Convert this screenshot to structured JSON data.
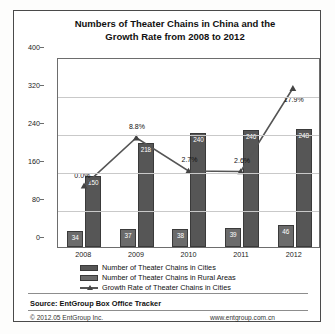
{
  "chart_data": {
    "type": "bar",
    "title": "Numbers of Theater Chains in China and the Growth Rate from 2008 to 2012",
    "title_line1": "Numbers of Theater Chains in China and the",
    "title_line2": "Growth Rate from 2008 to 2012",
    "xlabel": "",
    "ylabel": "",
    "categories": [
      "2008",
      "2009",
      "2010",
      "2011",
      "2012"
    ],
    "ylim": [
      0,
      400
    ],
    "yticks": [
      0,
      80,
      160,
      240,
      320,
      400
    ],
    "grid": true,
    "legend_position": "bottom",
    "series": [
      {
        "name": "Number of Theater Chains in Cities",
        "type": "bar",
        "color": "#565656",
        "values": [
          150,
          218,
          240,
          246,
          248
        ]
      },
      {
        "name": "Number of Theater Chains in Rural Areas",
        "type": "bar",
        "color": "#6b6b6b",
        "values": [
          34,
          37,
          38,
          39,
          46
        ]
      },
      {
        "name": "Growth Rate of Theater Chains in Cities",
        "type": "line",
        "color": "#555555",
        "unit": "%",
        "values": [
          0.0,
          8.8,
          2.7,
          2.6,
          17.9
        ],
        "labels": [
          "0.0%",
          "8.8%",
          "2.7%",
          "2.6%",
          "17.9%"
        ]
      }
    ]
  },
  "footer": {
    "source": "Source: EntGroup Box Office Tracker",
    "copyright": "© 2012.05 EntGroup Inc.",
    "url": "www.entgroup.com.cn"
  }
}
